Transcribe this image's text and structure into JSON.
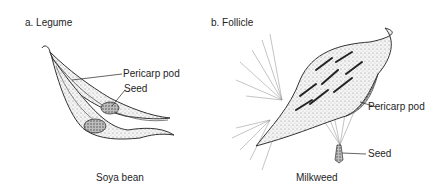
{
  "panels": [
    {
      "heading": "a.  Legume",
      "caption": "Soya bean",
      "labels": {
        "pericarp": "Pericarp pod",
        "seed": "Seed"
      }
    },
    {
      "heading": "b.  Follicle",
      "caption": "Milkweed",
      "labels": {
        "pericarp": "Pericarp pod",
        "seed": "Seed"
      }
    }
  ]
}
